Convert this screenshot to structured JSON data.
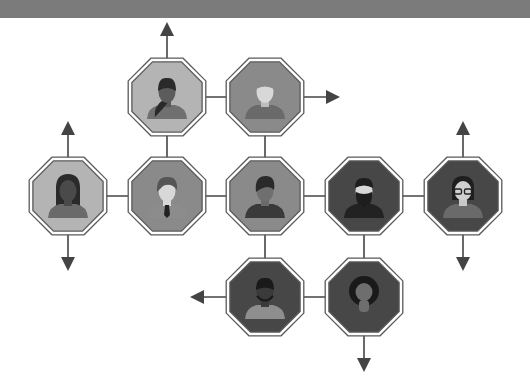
{
  "diagram": {
    "title": "",
    "colors": {
      "background": "#ffffff",
      "banner": "#7b7b7b",
      "line": "#444444",
      "octagon_border": "#5a5a5a",
      "light": "#b4b4b4",
      "mid": "#8a8a8a",
      "dark": "#474747"
    },
    "nodes": [
      {
        "id": "n1",
        "row": 0,
        "col": 1,
        "shade": "light",
        "avatar": "woman-ponytail-icon"
      },
      {
        "id": "n2",
        "row": 0,
        "col": 2,
        "shade": "mid",
        "avatar": "man-short-hair-icon"
      },
      {
        "id": "n3",
        "row": 1,
        "col": 0,
        "shade": "light",
        "avatar": "woman-long-hair-icon"
      },
      {
        "id": "n4",
        "row": 1,
        "col": 1,
        "shade": "mid",
        "avatar": "man-tie-icon"
      },
      {
        "id": "n5",
        "row": 1,
        "col": 2,
        "shade": "mid",
        "avatar": "woman-short-hair-icon"
      },
      {
        "id": "n6",
        "row": 1,
        "col": 3,
        "shade": "dark",
        "avatar": "man-beard-icon"
      },
      {
        "id": "n7",
        "row": 1,
        "col": 4,
        "shade": "dark",
        "avatar": "woman-glasses-icon"
      },
      {
        "id": "n8",
        "row": 2,
        "col": 2,
        "shade": "dark",
        "avatar": "man-stubble-icon"
      },
      {
        "id": "n9",
        "row": 2,
        "col": 3,
        "shade": "dark",
        "avatar": "woman-afro-icon"
      }
    ],
    "edges": [
      [
        "n1",
        "n2"
      ],
      [
        "n1",
        "n4"
      ],
      [
        "n2",
        "n5"
      ],
      [
        "n3",
        "n4"
      ],
      [
        "n4",
        "n5"
      ],
      [
        "n5",
        "n6"
      ],
      [
        "n6",
        "n7"
      ],
      [
        "n5",
        "n8"
      ],
      [
        "n6",
        "n9"
      ],
      [
        "n8",
        "n9"
      ]
    ],
    "arrows": [
      {
        "node": "n1",
        "dir": "up"
      },
      {
        "node": "n2",
        "dir": "right"
      },
      {
        "node": "n3",
        "dir": "up"
      },
      {
        "node": "n3",
        "dir": "down"
      },
      {
        "node": "n7",
        "dir": "up"
      },
      {
        "node": "n7",
        "dir": "down"
      },
      {
        "node": "n8",
        "dir": "left"
      },
      {
        "node": "n9",
        "dir": "down"
      }
    ]
  }
}
